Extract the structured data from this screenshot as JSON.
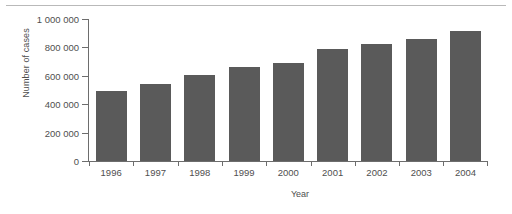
{
  "chart_data": {
    "type": "bar",
    "title": "",
    "xlabel": "Year",
    "ylabel": "Number of cases",
    "categories": [
      "1996",
      "1997",
      "1998",
      "1999",
      "2000",
      "2001",
      "2002",
      "2003",
      "2004"
    ],
    "values": [
      495000,
      545000,
      605000,
      665000,
      690000,
      790000,
      825000,
      860000,
      915000
    ],
    "ylim": [
      0,
      1000000
    ],
    "yticks": [
      0,
      200000,
      400000,
      600000,
      800000,
      1000000
    ],
    "ytick_labels": [
      "0",
      "200 000",
      "400 000",
      "600 000",
      "800 000",
      "1 000 000"
    ],
    "grid": false,
    "legend": null,
    "bar_color": "#5a5a5a",
    "axis_color": "#6d6d6d",
    "background": "#ffffff"
  },
  "figure": {
    "top_rule": true
  }
}
